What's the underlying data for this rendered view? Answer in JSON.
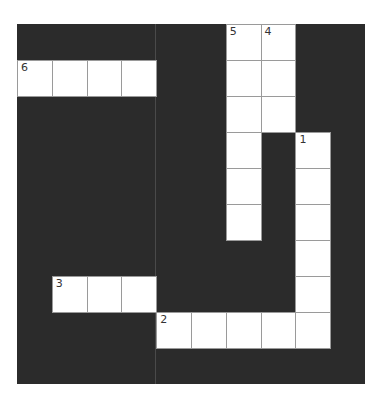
{
  "puzzle": {
    "rows": 10,
    "cols": 10,
    "cell_width": 34.8,
    "cell_height": 36,
    "colors": {
      "block": "#2b2b2b",
      "cell": "#ffffff",
      "cell_border": "#9a9a9a",
      "number": "#333333"
    },
    "white_cells": [
      [
        0,
        6
      ],
      [
        0,
        7
      ],
      [
        1,
        0
      ],
      [
        1,
        1
      ],
      [
        1,
        2
      ],
      [
        1,
        3
      ],
      [
        1,
        6
      ],
      [
        1,
        7
      ],
      [
        2,
        6
      ],
      [
        2,
        7
      ],
      [
        3,
        6
      ],
      [
        3,
        8
      ],
      [
        4,
        6
      ],
      [
        4,
        8
      ],
      [
        5,
        6
      ],
      [
        5,
        8
      ],
      [
        6,
        8
      ],
      [
        7,
        1
      ],
      [
        7,
        2
      ],
      [
        7,
        3
      ],
      [
        7,
        8
      ],
      [
        8,
        4
      ],
      [
        8,
        5
      ],
      [
        8,
        6
      ],
      [
        8,
        7
      ],
      [
        8,
        8
      ]
    ],
    "numbers": [
      {
        "row": 0,
        "col": 6,
        "label": "5"
      },
      {
        "row": 0,
        "col": 7,
        "label": "4"
      },
      {
        "row": 1,
        "col": 0,
        "label": "6"
      },
      {
        "row": 3,
        "col": 8,
        "label": "1"
      },
      {
        "row": 7,
        "col": 1,
        "label": "3"
      },
      {
        "row": 8,
        "col": 4,
        "label": "2"
      }
    ]
  }
}
